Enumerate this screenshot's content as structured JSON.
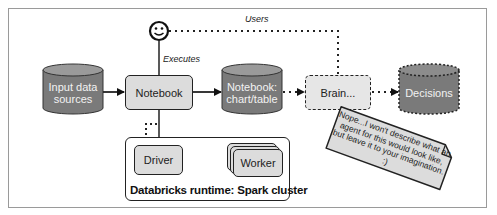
{
  "diagram": {
    "user": {
      "icon": "smiley-face-icon"
    },
    "edge_labels": {
      "users": "Users",
      "executes": "Executes"
    },
    "nodes": {
      "input": "Input data sources",
      "input_line1": "Input data",
      "input_line2": "sources",
      "notebook": "Notebook",
      "chart_line1": "Notebook:",
      "chart_line2": "chart/table",
      "brain": "Brain...",
      "decisions": "Decisions",
      "driver": "Driver",
      "worker": "Worker"
    },
    "cluster": {
      "title": "Databricks runtime: Spark cluster"
    },
    "note": {
      "text": "Nope...I won't describe what an agent for this would look like, but leave it to your imagination. :)"
    },
    "colors": {
      "cylinder_fill": "#7a7a7a",
      "box_fill": "#dcdcdc",
      "stroke": "#222222",
      "frame": "#9a9a9a"
    }
  }
}
